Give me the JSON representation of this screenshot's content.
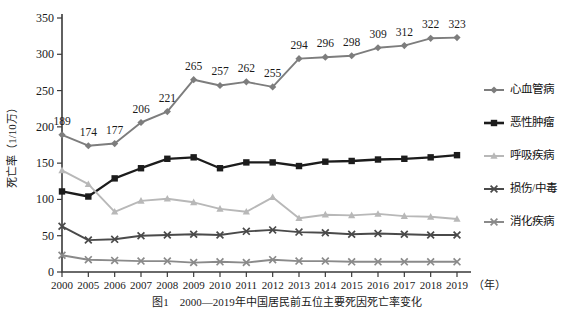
{
  "figure": {
    "caption": "图1　2000—2019年中国居民前五位主要死因死亡率变化",
    "background": "#ffffff"
  },
  "chart_data": {
    "type": "line",
    "title": "",
    "xlabel": "（年）",
    "ylabel": "死亡率（1/10万）",
    "x": [
      "2000",
      "2005",
      "2006",
      "2007",
      "2008",
      "2009",
      "2010",
      "2011",
      "2012",
      "2013",
      "2014",
      "2015",
      "2016",
      "2017",
      "2018",
      "2019"
    ],
    "ylim": [
      0,
      350
    ],
    "yticks": [
      0,
      50,
      100,
      150,
      200,
      250,
      300,
      350
    ],
    "grid": false,
    "legend_position": "right",
    "series": [
      {
        "name": "心血管病",
        "color": "#7d7d7d",
        "marker": "diamond",
        "labeled": true,
        "values": [
          189,
          174,
          177,
          206,
          221,
          265,
          257,
          262,
          255,
          294,
          296,
          298,
          309,
          312,
          322,
          323
        ]
      },
      {
        "name": "恶性肿瘤",
        "color": "#1c1c1c",
        "marker": "square",
        "labeled": false,
        "values": [
          111,
          104,
          129,
          143,
          156,
          158,
          143,
          151,
          151,
          146,
          152,
          153,
          155,
          156,
          158,
          161
        ]
      },
      {
        "name": "呼吸疾病",
        "color": "#b8b8b8",
        "marker": "triangle",
        "labeled": false,
        "values": [
          140,
          121,
          83,
          98,
          101,
          96,
          87,
          83,
          103,
          74,
          79,
          78,
          80,
          77,
          76,
          73
        ]
      },
      {
        "name": "损伤/中毒",
        "color": "#4a4a4a",
        "marker": "cross",
        "labeled": false,
        "values": [
          63,
          44,
          45,
          50,
          51,
          52,
          51,
          56,
          58,
          55,
          54,
          52,
          53,
          52,
          51,
          51
        ]
      },
      {
        "name": "消化疾病",
        "color": "#8a8a8a",
        "marker": "cross",
        "labeled": false,
        "values": [
          23,
          17,
          16,
          15,
          15,
          13,
          14,
          13,
          17,
          15,
          15,
          14,
          14,
          14,
          14,
          14
        ]
      }
    ]
  }
}
